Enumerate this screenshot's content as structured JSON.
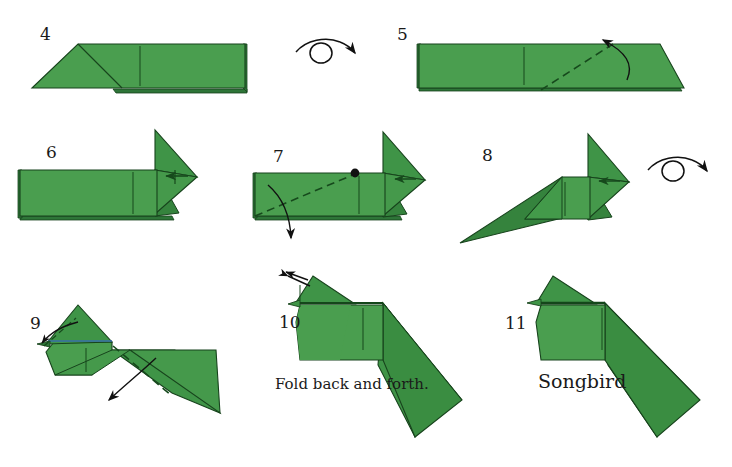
{
  "page": {
    "background": "#ffffff",
    "width": 732,
    "height": 467
  },
  "colors": {
    "paper_light": "#4a9e4f",
    "paper_mid": "#3f9447",
    "paper_dark": "#35833d",
    "paper_darker": "#2e7538",
    "outline": "#17431c",
    "crease": "#14521c",
    "arrow": "#111111",
    "text": "#1a1a1a",
    "edge_blue": "#3a6ea8"
  },
  "steps": [
    {
      "number": "4",
      "num_x": 40,
      "num_y": 26,
      "caption": "",
      "turnover_icon": "turn-over-arrow-icon",
      "description": "Flat parallelogram with left triangle flap"
    },
    {
      "number": "5",
      "num_x": 397,
      "num_y": 26,
      "caption": "",
      "turnover_icon": "",
      "description": "Long flat shape with dashed valley fold at right and arrow folding up-left"
    },
    {
      "number": "6",
      "num_x": 46,
      "num_y": 144,
      "caption": "",
      "turnover_icon": "",
      "description": "Body with pointed head; small reverse-fold arrow at beak"
    },
    {
      "number": "7",
      "num_x": 273,
      "num_y": 148,
      "caption": "",
      "turnover_icon": "",
      "description": "Body with black reference dot and long dashed fold; arrow swings down"
    },
    {
      "number": "8",
      "num_x": 482,
      "num_y": 147,
      "caption": "",
      "turnover_icon": "turn-over-arrow-icon",
      "description": "Bird shape with tail swung down-left"
    },
    {
      "number": "9",
      "num_x": 30,
      "num_y": 315,
      "caption": "",
      "turnover_icon": "",
      "description": "Bird with head up, dashed fold at tail, arrow pointing down-left"
    },
    {
      "number": "10",
      "num_x": 279,
      "num_y": 314,
      "caption": "Fold back and forth.",
      "caption_x": 275,
      "caption_y": 377,
      "caption_size": "small",
      "turnover_icon": "",
      "description": "Near-finished bird with double-headed arrow at the beak"
    },
    {
      "number": "11",
      "num_x": 505,
      "num_y": 315,
      "caption": "Songbird",
      "caption_x": 538,
      "caption_y": 372,
      "caption_size": "big",
      "turnover_icon": "",
      "description": "Completed songbird model"
    }
  ],
  "icons": {
    "turn_over": "turn-over-arrow-icon",
    "fold_arrow": "fold-arrow-icon",
    "back_and_forth_arrow": "back-and-forth-arrow-icon",
    "reference_dot": "reference-dot-icon"
  },
  "turnovers": [
    {
      "name": "turn-over-icon-step4",
      "x": 294,
      "y": 30
    },
    {
      "name": "turn-over-icon-step8",
      "x": 650,
      "y": 148
    }
  ]
}
